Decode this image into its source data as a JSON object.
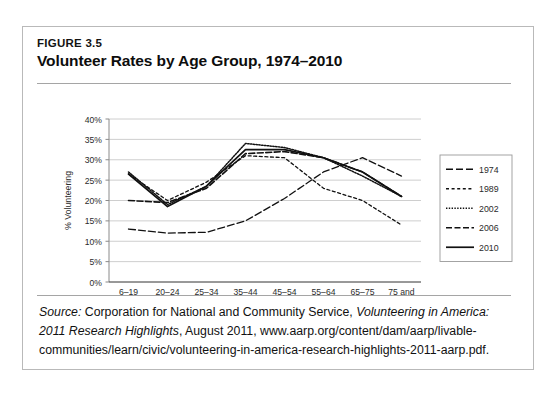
{
  "figure": {
    "number": "FIGURE 3.5",
    "title": "Volunteer Rates by Age Group, 1974–2010"
  },
  "source": {
    "label": "Source:",
    "text_before_italic": " Corporation for National and Community Service, ",
    "italic_title": "Volunteering in America: 2011 Research Highlights",
    "text_after_italic": ", August 2011, www.aarp.org/content/dam/aarp/livable-communities/learn/civic/volunteering-in-america-research-highlights-2011-aarp.pdf."
  },
  "chart_data": {
    "type": "line",
    "title": "Volunteer Rates by Age Group, 1974–2010",
    "xlabel": "Age as of Survey Week",
    "ylabel": "% Volunteering",
    "categories": [
      "6–19",
      "20–24",
      "25–34",
      "35–44",
      "45–54",
      "55–64",
      "65–75",
      "75 and older"
    ],
    "ytick_labels": [
      "0%",
      "5%",
      "10%",
      "15%",
      "20%",
      "25%",
      "30%",
      "35%",
      "40%"
    ],
    "ytick_values": [
      0,
      5,
      10,
      15,
      20,
      25,
      30,
      35,
      40
    ],
    "ylim": [
      0,
      40
    ],
    "grid": true,
    "grid_axis": "y",
    "legend_position": "right",
    "series": [
      {
        "name": "1974",
        "style": "long-dash",
        "dasharray": "7,3",
        "width": 1.3,
        "values": [
          13.0,
          12.0,
          12.2,
          15.0,
          20.5,
          27.0,
          30.5,
          26.0
        ]
      },
      {
        "name": "1989",
        "style": "short-dash",
        "dasharray": "3,2.6",
        "width": 1.3,
        "values": [
          26.5,
          20.0,
          24.5,
          31.0,
          30.5,
          23.0,
          20.0,
          14.0
        ]
      },
      {
        "name": "2002",
        "style": "fine-dotted",
        "dasharray": "1.4,1.4",
        "width": 1.5,
        "values": [
          27.0,
          19.0,
          23.5,
          34.0,
          33.0,
          30.5,
          26.0,
          21.0
        ]
      },
      {
        "name": "2006",
        "style": "dash-dash",
        "dasharray": "6,2.5",
        "width": 1.6,
        "values": [
          20.0,
          19.5,
          23.0,
          31.5,
          32.0,
          30.5,
          27.0,
          21.0
        ]
      },
      {
        "name": "2010",
        "style": "solid",
        "dasharray": "none",
        "width": 1.7,
        "values": [
          26.5,
          18.5,
          23.5,
          32.5,
          32.5,
          30.5,
          27.0,
          21.0
        ]
      }
    ],
    "series_note_1974": "The 1974 series is plotted shifted: values rise from the youngest through the 65–75 group and fall at 75 and older.",
    "colors": {
      "line": "#111111",
      "grid": "#c8c8c8",
      "axis": "#8a8a8a",
      "text": "#2b2b2b"
    }
  }
}
